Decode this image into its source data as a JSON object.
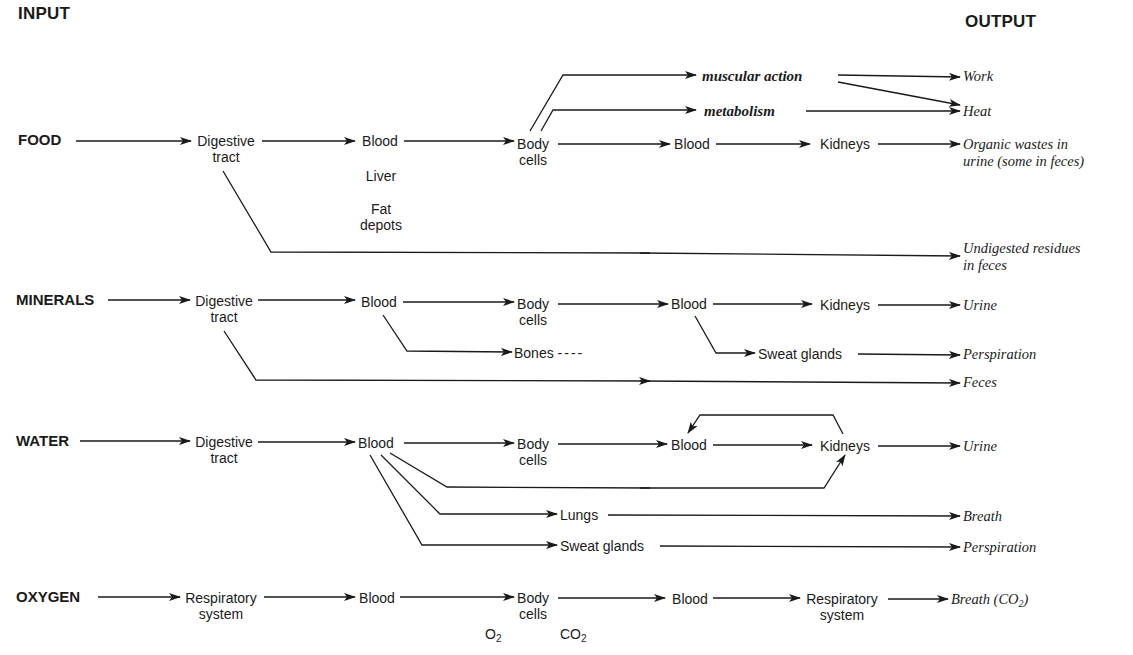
{
  "headers": {
    "input": "INPUT",
    "output": "OUTPUT"
  },
  "colors": {
    "ink": "#1a1a1a",
    "background": "#ffffff"
  },
  "food": {
    "source": "FOOD",
    "digestive": [
      "Digestive",
      "tract"
    ],
    "blood": "Blood",
    "liver": "Liver",
    "fat": [
      "Fat",
      "depots"
    ],
    "body_cells": [
      "Body",
      "cells"
    ],
    "muscular_action": "muscular action",
    "metabolism": "metabolism",
    "blood2": "Blood",
    "kidneys": "Kidneys",
    "out_work": "Work",
    "out_heat": "Heat",
    "out_organic": [
      "Organic wastes in",
      "urine (some in feces)"
    ],
    "out_undigested": [
      "Undigested residues",
      "in feces"
    ]
  },
  "minerals": {
    "source": "MINERALS",
    "digestive": [
      "Digestive",
      "tract"
    ],
    "blood": "Blood",
    "body_cells": [
      "Body",
      "cells"
    ],
    "bones": "Bones",
    "bones_dash": "----",
    "blood2": "Blood",
    "kidneys": "Kidneys",
    "sweat": "Sweat glands",
    "out_urine": "Urine",
    "out_perspiration": "Perspiration",
    "out_feces": "Feces"
  },
  "water": {
    "source": "WATER",
    "digestive": [
      "Digestive",
      "tract"
    ],
    "blood": "Blood",
    "body_cells": [
      "Body",
      "cells"
    ],
    "blood2": "Blood",
    "kidneys": "Kidneys",
    "lungs": "Lungs",
    "sweat": "Sweat glands",
    "out_urine": "Urine",
    "out_breath": "Breath",
    "out_perspiration": "Perspiration"
  },
  "oxygen": {
    "source": "OXYGEN",
    "respiratory": [
      "Respiratory",
      "system"
    ],
    "blood": "Blood",
    "body_cells": [
      "Body",
      "cells"
    ],
    "o2": "O",
    "o2_sub": "2",
    "co2": "CO",
    "co2_sub": "2",
    "blood2": "Blood",
    "respiratory2": [
      "Respiratory",
      "system"
    ],
    "out_breath": "Breath (CO",
    "out_breath_sub": "2",
    "out_breath_end": ")"
  }
}
